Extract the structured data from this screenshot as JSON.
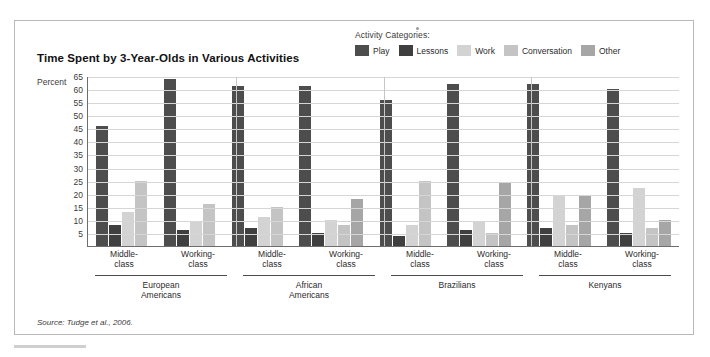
{
  "chart_title": "Time Spent by 3-Year-Olds in Various Activities",
  "axis_unit_label": "Percent",
  "source_note": "Source: Tudge et al., 2006.",
  "legend": {
    "title": "Activity Categories:",
    "items": [
      {
        "label": "Play",
        "color": "#4d4d4d"
      },
      {
        "label": "Lessons",
        "color": "#3f3f3f"
      },
      {
        "label": "Work",
        "color": "#d3d3d3"
      },
      {
        "label": "Conversation",
        "color": "#c4c4c4"
      },
      {
        "label": "Other",
        "color": "#a6a6a6"
      }
    ]
  },
  "chart_data": {
    "type": "bar",
    "title": "Time Spent by 3-Year-Olds in Various Activities",
    "xlabel": "",
    "ylabel": "Percent",
    "ylim": [
      0,
      65
    ],
    "yticks": [
      65,
      60,
      55,
      50,
      45,
      40,
      35,
      30,
      25,
      20,
      15,
      10,
      5
    ],
    "grid": true,
    "legend_position": "top-right",
    "categories": [
      "European Americans Middle-class",
      "European Americans Working-class",
      "African Americans Middle-class",
      "African Americans Working-class",
      "Brazilians Middle-class",
      "Brazilians Working-class",
      "Kenyans Middle-class",
      "Kenyans Working-class"
    ],
    "group_labels": [
      "European\nAmericans",
      "African\nAmericans",
      "Brazilians",
      "Kenyans"
    ],
    "subgroup_labels": [
      "Middle-class",
      "Working-class"
    ],
    "series": [
      {
        "name": "Play",
        "values": [
          46,
          64,
          61,
          61,
          56,
          62,
          62,
          60
        ]
      },
      {
        "name": "Lessons",
        "values": [
          8,
          6,
          7,
          5,
          4,
          6,
          7,
          5
        ]
      },
      {
        "name": "Work",
        "values": [
          13,
          9,
          11,
          10,
          8,
          9,
          19,
          22
        ]
      },
      {
        "name": "Conversation",
        "values": [
          25,
          16,
          15,
          8,
          25,
          5,
          8,
          7
        ]
      },
      {
        "name": "Other",
        "values": [
          0,
          0,
          0,
          18,
          0,
          24,
          19,
          10
        ]
      }
    ]
  },
  "x_axis": {
    "subgroups": [
      "Middle-\nclass",
      "Working-\nclass",
      "Middle-\nclass",
      "Working-\nclass",
      "Middle-\nclass",
      "Working-\nclass",
      "Middle-\nclass",
      "Working-\nclass"
    ],
    "groups": [
      "European\nAmericans",
      "African\nAmericans",
      "Brazilians",
      "Kenyans"
    ]
  }
}
